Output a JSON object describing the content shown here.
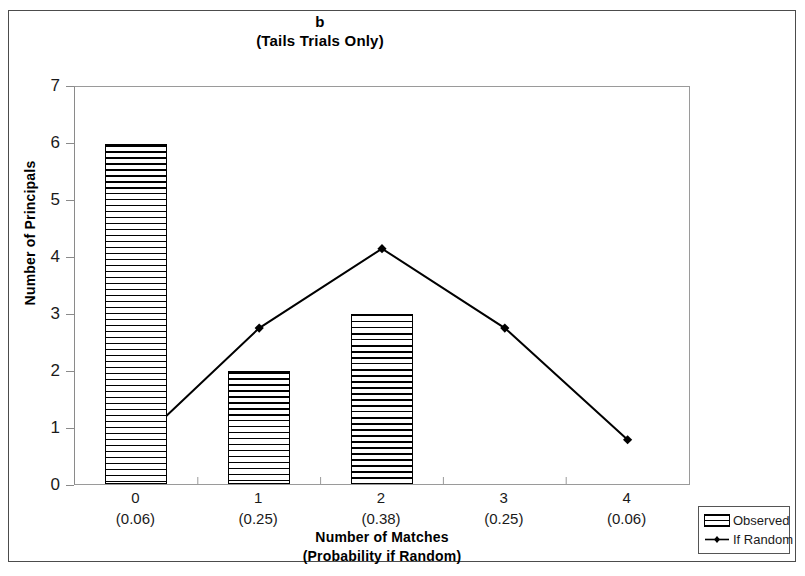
{
  "chart_data": {
    "type": "bar",
    "title": "b",
    "subtitle": "(Tails Trials Only)",
    "xlabel": "Number of Matches",
    "xlabel_line2": "(Probability if Random)",
    "ylabel": "Number of Principals",
    "categories": [
      "0",
      "1",
      "2",
      "3",
      "4"
    ],
    "category_sublabels": [
      "(0.06)",
      "(0.25)",
      "(0.38)",
      "(0.25)",
      "(0.06)"
    ],
    "ylim": [
      0,
      7
    ],
    "y_ticks": [
      "7",
      "6",
      "5",
      "4",
      "3",
      "2",
      "1",
      "0"
    ],
    "grid": false,
    "legend_position": "outside-bottom-right",
    "series": [
      {
        "name": "Observed",
        "kind": "bar",
        "values": [
          6,
          2,
          3,
          0,
          0
        ],
        "fill": "horizontal-hatch",
        "color": "#000000"
      },
      {
        "name": "If Random",
        "kind": "line",
        "values": [
          0.7,
          2.75,
          4.15,
          2.75,
          0.78
        ],
        "marker": "diamond",
        "color": "#000000"
      }
    ]
  },
  "legend": {
    "items": [
      {
        "label": "Observed",
        "icon": "hatched-bar-swatch"
      },
      {
        "label": "If Random",
        "icon": "line-diamond-swatch"
      }
    ]
  }
}
